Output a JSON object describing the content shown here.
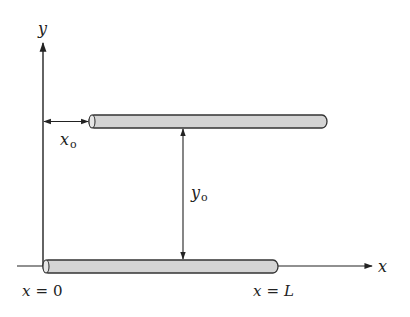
{
  "diagram": {
    "type": "two parallel rods in a coordinate frame",
    "colors": {
      "line": "#222222",
      "rod_fill": "#d4d4d4",
      "rod_stroke": "#333333",
      "background": "#ffffff"
    },
    "axes": {
      "x_label": "x",
      "y_label": "y"
    },
    "dimensions": {
      "x_offset": {
        "symbol": "x",
        "subscript": "o"
      },
      "y_offset": {
        "symbol": "y",
        "subscript": "o"
      }
    },
    "rods": [
      {
        "name": "upper-rod",
        "position": "offset by x_o horizontally and y_o vertically"
      },
      {
        "name": "lower-rod",
        "position": "along x-axis from x = 0 to x = L"
      }
    ],
    "annotations": {
      "start": {
        "lhs": "x",
        "eq": "=",
        "rhs": "0"
      },
      "end": {
        "lhs": "x",
        "eq": "=",
        "rhs": "L"
      }
    }
  }
}
